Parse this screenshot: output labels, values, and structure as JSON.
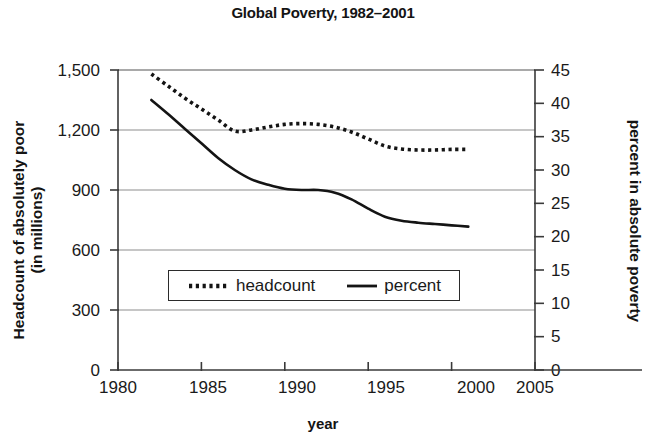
{
  "chart_data": {
    "type": "line",
    "title": "Global Poverty, 1982–2001",
    "xlabel": "year",
    "ylabel": "Headcount of absolutely poor (in millions)",
    "ylabel_line1": "Headcount of absolutely poor",
    "ylabel_line2": "(in millions)",
    "y2label": "percent in absolute poverty",
    "grid": true,
    "legend_position": "center",
    "xlim": [
      1980,
      2005
    ],
    "ylim": [
      0,
      1500
    ],
    "y2lim": [
      0,
      45
    ],
    "xticks": [
      "1980",
      "1985",
      "1990",
      "1995",
      "2000",
      "2005"
    ],
    "xtick_values": [
      1980,
      1985,
      1990,
      1995,
      2000,
      2005
    ],
    "yticks": [
      "0",
      "300",
      "600",
      "900",
      "1,200",
      "1,500"
    ],
    "ytick_values": [
      0,
      300,
      600,
      900,
      1200,
      1500
    ],
    "y2ticks": [
      "0",
      "5",
      "10",
      "15",
      "20",
      "25",
      "30",
      "35",
      "40",
      "45"
    ],
    "y2tick_values": [
      0,
      5,
      10,
      15,
      20,
      25,
      30,
      35,
      40,
      45
    ],
    "x": [
      1982,
      1983,
      1984,
      1985,
      1986,
      1987,
      1988,
      1989,
      1990,
      1991,
      1992,
      1993,
      1994,
      1995,
      1996,
      1997,
      1998,
      1999,
      2000,
      2001
    ],
    "series": [
      {
        "name": "headcount",
        "axis": "left",
        "style": "dotted",
        "color": "#141414",
        "values": [
          1480,
          1420,
          1360,
          1305,
          1250,
          1195,
          1200,
          1215,
          1228,
          1232,
          1228,
          1215,
          1190,
          1155,
          1120,
          1105,
          1100,
          1100,
          1103,
          1103
        ]
      },
      {
        "name": "percent",
        "axis": "right",
        "style": "solid",
        "color": "#141414",
        "values": [
          40.5,
          38.4,
          36.2,
          34.0,
          31.8,
          30.0,
          28.6,
          27.8,
          27.2,
          27.0,
          27.0,
          26.6,
          25.6,
          24.2,
          23.0,
          22.4,
          22.1,
          21.9,
          21.7,
          21.5
        ]
      }
    ],
    "legend": [
      {
        "label": "headcount",
        "style": "dotted"
      },
      {
        "label": "percent",
        "style": "solid"
      }
    ]
  }
}
